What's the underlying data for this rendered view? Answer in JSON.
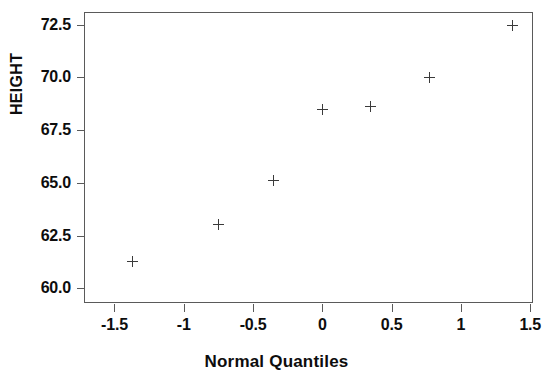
{
  "chart_data": {
    "type": "scatter",
    "title": "",
    "xlabel": "Normal Quantiles",
    "ylabel": "HEIGHT",
    "xlim": [
      -1.72,
      1.52
    ],
    "ylim": [
      59.3,
      73.1
    ],
    "grid": false,
    "legend": null,
    "marker": "plus",
    "marker_color": "#3a3a3a",
    "xticks": [
      -1.5,
      -1,
      -0.5,
      0,
      0.5,
      1,
      1.5
    ],
    "xticklabels": [
      "-1.5",
      "-1",
      "-0.5",
      "0",
      "0.5",
      "1",
      "1.5"
    ],
    "yticks": [
      60.0,
      62.5,
      65.0,
      67.5,
      70.0,
      72.5
    ],
    "yticklabels": [
      "60.0",
      "62.5",
      "65.0",
      "67.5",
      "70.0",
      "72.5"
    ],
    "x": [
      -1.37,
      -0.75,
      -0.35,
      0.0,
      0.35,
      0.77,
      1.37
    ],
    "y": [
      61.25,
      63.0,
      65.1,
      68.5,
      68.6,
      70.0,
      72.45
    ],
    "points": [
      {
        "x": -1.37,
        "y": 61.25
      },
      {
        "x": -0.75,
        "y": 63.0
      },
      {
        "x": -0.35,
        "y": 65.1
      },
      {
        "x": 0.0,
        "y": 68.5
      },
      {
        "x": 0.35,
        "y": 68.6
      },
      {
        "x": 0.77,
        "y": 70.0
      },
      {
        "x": 1.37,
        "y": 72.45
      }
    ]
  }
}
